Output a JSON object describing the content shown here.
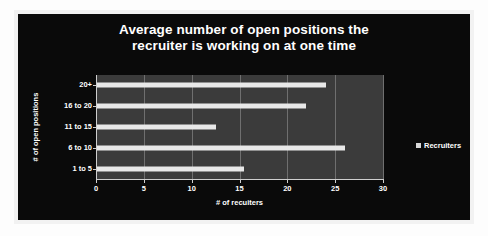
{
  "chart_data": {
    "type": "bar",
    "orientation": "horizontal",
    "title": "Average number of open positions the recruiter is working on at one time",
    "title_lines": [
      "Average number of open positions the",
      "recruiter is working on at one time"
    ],
    "categories": [
      "1 to 5",
      "6 to 10",
      "11 to 15",
      "16 to 20",
      "20+"
    ],
    "values": [
      15.5,
      26,
      12.5,
      22,
      24
    ],
    "series": [
      {
        "name": "Recruiters",
        "values": [
          15.5,
          26,
          12.5,
          22,
          24
        ]
      }
    ],
    "xlabel": "# of recuiters",
    "ylabel": "# of open positions",
    "xlim": [
      0,
      30
    ],
    "xticks": [
      0,
      5,
      10,
      15,
      20,
      25,
      30
    ],
    "xtick_labels": [
      "0",
      "5",
      "10",
      "15",
      "20",
      "25",
      "30"
    ],
    "grid": true,
    "grid_axis": "x",
    "legend": {
      "position": "right",
      "entries": [
        {
          "label": "Recruiters",
          "swatch": "legend-swatch-icon",
          "color": "#d8d8d8"
        }
      ]
    },
    "colors": {
      "background": "#0a0a0a",
      "plot_area": "#3b3b3b",
      "bar": "#e8e8e8",
      "text": "#ffffff",
      "gridline": "#6f6f6f",
      "axis": "#cfcfcf",
      "frame": "#f2f2f2"
    }
  }
}
